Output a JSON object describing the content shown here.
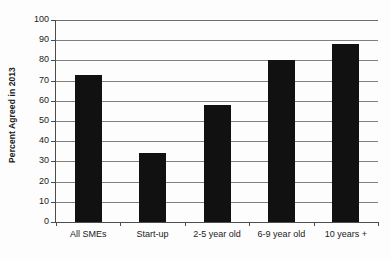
{
  "chart_data": {
    "type": "bar",
    "title": "",
    "subtitle": "",
    "xlabel": "",
    "ylabel": "Percent Agreed in 2013",
    "categories": [
      "All SMEs",
      "Start-up",
      "2-5 year old",
      "6-9 year old",
      "10 years +"
    ],
    "values": [
      73,
      34,
      58,
      80,
      88
    ],
    "ylim": [
      0,
      100
    ],
    "yticks": [
      0,
      10,
      20,
      30,
      40,
      50,
      60,
      70,
      80,
      90,
      100
    ],
    "ytick_labels": [
      "0",
      "10",
      "20",
      "30",
      "40",
      "50",
      "60",
      "70",
      "80",
      "90",
      "100"
    ],
    "grid": true,
    "legend": false,
    "legend_position": "none",
    "series": [
      {
        "name": "Percent Agreed in 2013",
        "values": [
          73,
          34,
          58,
          80,
          88
        ],
        "color": "#111111"
      }
    ],
    "colors": {
      "bar": "#111111",
      "gridline": "#808080",
      "axis": "#4d4d4d",
      "background": "#fdfdfd",
      "text": "#1a1a1a"
    }
  }
}
